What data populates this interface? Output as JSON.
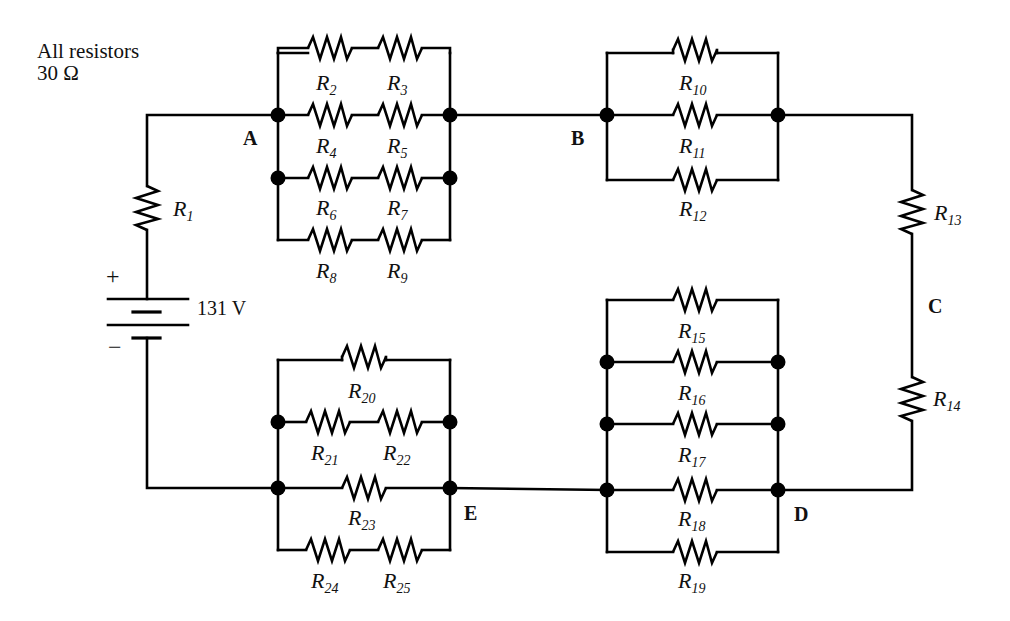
{
  "note": {
    "line1": "All resistors",
    "line2": "30 Ω"
  },
  "source": {
    "voltage_label": "131 V",
    "plus": "+",
    "minus": "−"
  },
  "points": {
    "A": "A",
    "B": "B",
    "C": "C",
    "D": "D",
    "E": "E"
  },
  "resistors": {
    "r1": {
      "letter": "R",
      "sub": "1"
    },
    "r2": {
      "letter": "R",
      "sub": "2"
    },
    "r3": {
      "letter": "R",
      "sub": "3"
    },
    "r4": {
      "letter": "R",
      "sub": "4"
    },
    "r5": {
      "letter": "R",
      "sub": "5"
    },
    "r6": {
      "letter": "R",
      "sub": "6"
    },
    "r7": {
      "letter": "R",
      "sub": "7"
    },
    "r8": {
      "letter": "R",
      "sub": "8"
    },
    "r9": {
      "letter": "R",
      "sub": "9"
    },
    "r10": {
      "letter": "R",
      "sub": "10"
    },
    "r11": {
      "letter": "R",
      "sub": "11"
    },
    "r12": {
      "letter": "R",
      "sub": "12"
    },
    "r13": {
      "letter": "R",
      "sub": "13"
    },
    "r14": {
      "letter": "R",
      "sub": "14"
    },
    "r15": {
      "letter": "R",
      "sub": "15"
    },
    "r16": {
      "letter": "R",
      "sub": "16"
    },
    "r17": {
      "letter": "R",
      "sub": "17"
    },
    "r18": {
      "letter": "R",
      "sub": "18"
    },
    "r19": {
      "letter": "R",
      "sub": "19"
    },
    "r20": {
      "letter": "R",
      "sub": "20"
    },
    "r21": {
      "letter": "R",
      "sub": "21"
    },
    "r22": {
      "letter": "R",
      "sub": "22"
    },
    "r23": {
      "letter": "R",
      "sub": "23"
    },
    "r24": {
      "letter": "R",
      "sub": "24"
    },
    "r25": {
      "letter": "R",
      "sub": "25"
    }
  },
  "colors": {
    "ink": "#000000",
    "background": "#ffffff"
  }
}
